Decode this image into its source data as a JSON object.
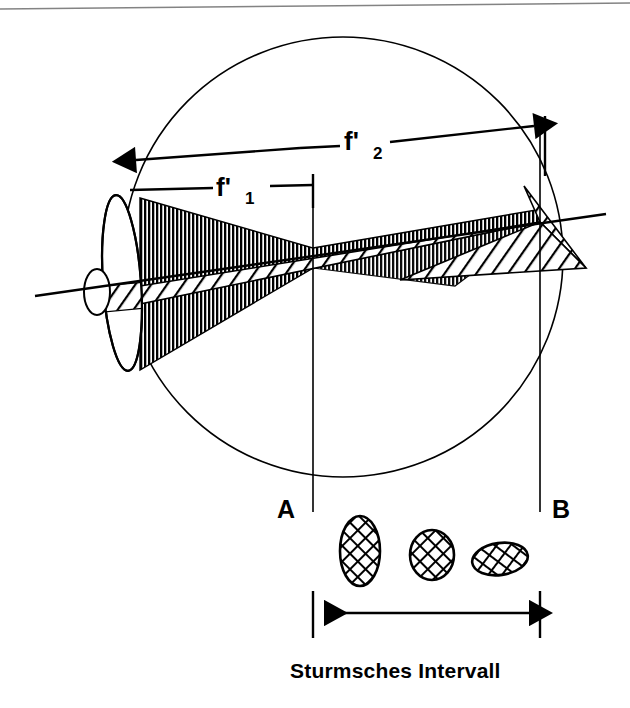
{
  "figure": {
    "title": "Sturmsches Intervall",
    "kind": "optics-diagram"
  },
  "labels": {
    "focal_first": "f'",
    "focal_first_sub": "1",
    "focal_second": "f'",
    "focal_second_sub": "2",
    "point_a": "A",
    "point_b": "B",
    "caption": "Sturmsches Intervall"
  },
  "colors": {
    "ink": "#000000",
    "paper": "#ffffff",
    "scan_edge": "#6d6d6d"
  },
  "geometry": {
    "eye_circle": {
      "cx": 343,
      "cy": 257,
      "r": 220
    },
    "lens_ellipse": {
      "cx": 122,
      "cy": 283,
      "rx": 19,
      "ry": 88,
      "rotation": -4
    },
    "pupil_ellipse": {
      "cx": 97,
      "cy": 292,
      "rx": 13,
      "ry": 23
    },
    "focal_line_a_x": 313,
    "focal_line_b_x": 540,
    "optical_axis": {
      "x1": 35,
      "y1": 296,
      "x2": 606,
      "y2": 214
    }
  },
  "dimensions": [
    {
      "name": "f-prime-1",
      "from_x": 128,
      "to_x": 313,
      "y": 186,
      "label": "f'",
      "sub": "1"
    },
    {
      "name": "f-prime-2",
      "from_x": 128,
      "to_x": 545,
      "y_from": 160,
      "y_to": 126,
      "label": "f'",
      "sub": "2"
    },
    {
      "name": "sturm-interval",
      "from_x": 313,
      "to_x": 540,
      "y": 612,
      "label": "Sturmsches Intervall"
    }
  ],
  "blur_spots": [
    {
      "name": "blur-spot-vertical-ellipse",
      "cx": 360,
      "cy": 551,
      "rx": 20,
      "ry": 35,
      "rotation": 0
    },
    {
      "name": "blur-spot-circle",
      "cx": 432,
      "cy": 555,
      "rx": 22,
      "ry": 25,
      "rotation": 0
    },
    {
      "name": "blur-spot-horizontal-ellipse",
      "cx": 500,
      "cy": 559,
      "rx": 28,
      "ry": 16,
      "rotation": -8
    }
  ],
  "hatching": {
    "vertical_cone_note": "dense vertical line fill, converges at focal line A",
    "diagonal_cone_note": "diagonal line fill, converges at focal line B"
  }
}
